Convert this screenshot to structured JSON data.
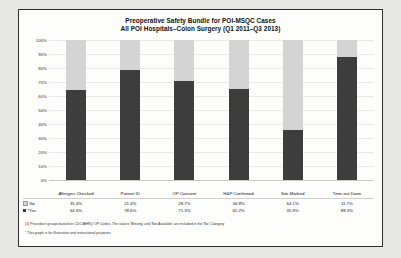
{
  "title": {
    "line1": "Preoperative Safety Bundle for POI-MSQC Cases",
    "line2": "All POI Hospitals–Colon Surgery (Q1 2011–Q3 2013)"
  },
  "legend": {
    "no_label": "No",
    "yes_label": "*Yes"
  },
  "footnotes": {
    "note1": "(1)   Procedure groups based on CDC/AHRQ OP Codes. The values 'Missing' and 'Not Available' are included in the 'No' Category",
    "note2": "* This graph is for illustrative and instructional purposes"
  },
  "colors": {
    "no": "#d4d4d4",
    "yes": "#3d3d3d",
    "border": "#2e2e2e",
    "page": "#fdfdfc",
    "background": "#e8e8e6"
  },
  "chart_data": {
    "type": "bar",
    "stacked": true,
    "normalized_percent": true,
    "xlabel": "",
    "ylabel": "",
    "ylim": [
      0,
      100
    ],
    "yticks": [
      "0%",
      "10%",
      "20%",
      "30%",
      "40%",
      "50%",
      "60%",
      "70%",
      "80%",
      "90%",
      "100%"
    ],
    "grid": true,
    "legend_position": "bottom-left",
    "categories": [
      "Allergies Checked",
      "Patient ID",
      "OP Consent",
      "H&P Confirmed",
      "Site Marked",
      "Time-out Done"
    ],
    "series": [
      {
        "name": "No",
        "color": "#d4d4d4",
        "values": [
          35.4,
          21.4,
          28.7,
          34.8,
          64.1,
          11.7
        ],
        "labels": [
          "35.4%",
          "21.4%",
          "28.7%",
          "34.8%",
          "64.1%",
          "11.7%"
        ]
      },
      {
        "name": "*Yes",
        "color": "#3d3d3d",
        "values": [
          64.6,
          78.6,
          71.3,
          65.2,
          35.9,
          88.3
        ],
        "labels": [
          "64.6%",
          "78.6%",
          "71.3%",
          "65.2%",
          "35.9%",
          "88.3%"
        ]
      }
    ]
  }
}
